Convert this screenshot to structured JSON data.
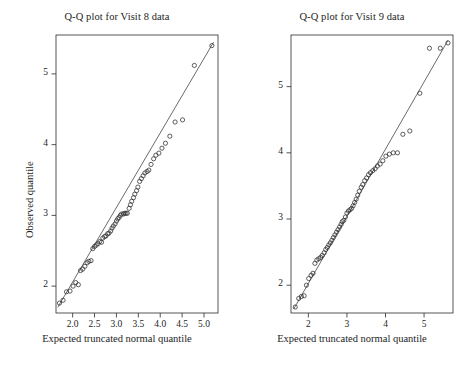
{
  "figure": {
    "width": 469,
    "height": 366,
    "background": "#ffffff",
    "ink_color": "#2b2b2b",
    "marker": "open-circle"
  },
  "chart_data": [
    {
      "type": "scatter",
      "panel": "left",
      "title": "Q-Q plot for Visit 8 data",
      "xlabel": "Expected truncated normal quantile",
      "ylabel": "Observed quantile",
      "grid": false,
      "legend": null,
      "xlim": [
        1.62,
        5.32
      ],
      "ylim": [
        1.62,
        5.55
      ],
      "xticks": [
        "2.0",
        "2.5",
        "3.0",
        "3.5",
        "4.0",
        "4.5",
        "5.0"
      ],
      "xtick_values": [
        2.0,
        2.5,
        3.0,
        3.5,
        4.0,
        4.5,
        5.0
      ],
      "yticks": [
        "2",
        "3",
        "4",
        "5"
      ],
      "ytick_values": [
        2,
        3,
        4,
        5
      ],
      "reference_line": {
        "x0": 1.66,
        "y0": 1.7,
        "x1": 5.22,
        "y1": 5.45
      },
      "x": [
        1.7,
        1.78,
        1.86,
        1.94,
        2.01,
        2.07,
        2.13,
        2.18,
        2.23,
        2.28,
        2.33,
        2.37,
        2.42,
        2.46,
        2.5,
        2.54,
        2.58,
        2.62,
        2.66,
        2.69,
        2.73,
        2.76,
        2.8,
        2.83,
        2.87,
        2.9,
        2.93,
        2.97,
        3.0,
        3.03,
        3.06,
        3.09,
        3.12,
        3.16,
        3.19,
        3.22,
        3.25,
        3.29,
        3.32,
        3.35,
        3.39,
        3.42,
        3.46,
        3.49,
        3.53,
        3.57,
        3.61,
        3.65,
        3.7,
        3.74,
        3.79,
        3.85,
        3.9,
        3.97,
        4.04,
        4.12,
        4.22,
        4.34,
        4.51,
        4.78,
        5.18
      ],
      "y": [
        1.76,
        1.8,
        1.92,
        1.93,
        2.0,
        2.05,
        2.02,
        2.22,
        2.24,
        2.28,
        2.33,
        2.35,
        2.36,
        2.53,
        2.56,
        2.58,
        2.6,
        2.63,
        2.62,
        2.68,
        2.7,
        2.71,
        2.74,
        2.75,
        2.78,
        2.82,
        2.85,
        2.88,
        2.92,
        2.95,
        2.97,
        3.0,
        3.02,
        3.02,
        3.03,
        3.03,
        3.03,
        3.1,
        3.15,
        3.2,
        3.25,
        3.3,
        3.35,
        3.4,
        3.48,
        3.52,
        3.56,
        3.6,
        3.62,
        3.64,
        3.72,
        3.8,
        3.85,
        3.88,
        3.95,
        4.02,
        4.12,
        4.32,
        4.35,
        5.12,
        5.4
      ]
    },
    {
      "type": "scatter",
      "panel": "right",
      "title": "Q-Q plot for Visit 9 data",
      "xlabel": "Expected truncated normal quantile",
      "ylabel": "Observed quantile",
      "grid": false,
      "legend": null,
      "xlim": [
        1.55,
        5.75
      ],
      "ylim": [
        1.58,
        5.78
      ],
      "xticks": [
        "2",
        "3",
        "4",
        "5"
      ],
      "xtick_values": [
        2,
        3,
        4,
        5
      ],
      "yticks": [
        "2",
        "3",
        "4",
        "5"
      ],
      "ytick_values": [
        2,
        3,
        4,
        5
      ],
      "reference_line": {
        "x0": 1.62,
        "y0": 1.64,
        "x1": 5.62,
        "y1": 5.7
      },
      "x": [
        1.66,
        1.75,
        1.82,
        1.89,
        1.95,
        2.01,
        2.07,
        2.12,
        2.17,
        2.22,
        2.27,
        2.32,
        2.36,
        2.41,
        2.45,
        2.49,
        2.53,
        2.57,
        2.61,
        2.65,
        2.69,
        2.73,
        2.77,
        2.81,
        2.85,
        2.88,
        2.92,
        2.96,
        3.0,
        3.04,
        3.08,
        3.12,
        3.16,
        3.2,
        3.24,
        3.28,
        3.32,
        3.37,
        3.41,
        3.46,
        3.51,
        3.56,
        3.61,
        3.67,
        3.73,
        3.79,
        3.86,
        3.93,
        4.01,
        4.1,
        4.2,
        4.31,
        4.45,
        4.63,
        4.89,
        5.14,
        5.42,
        5.62
      ],
      "y": [
        1.67,
        1.8,
        1.83,
        1.84,
        2.0,
        2.1,
        2.15,
        2.18,
        2.33,
        2.38,
        2.4,
        2.42,
        2.45,
        2.49,
        2.54,
        2.57,
        2.61,
        2.64,
        2.68,
        2.72,
        2.76,
        2.8,
        2.84,
        2.88,
        2.92,
        2.96,
        2.98,
        3.03,
        3.09,
        3.12,
        3.14,
        3.16,
        3.2,
        3.25,
        3.3,
        3.36,
        3.42,
        3.48,
        3.52,
        3.58,
        3.62,
        3.67,
        3.7,
        3.73,
        3.76,
        3.8,
        3.83,
        3.88,
        3.95,
        3.98,
        4.0,
        4.0,
        4.28,
        4.33,
        4.9,
        5.58,
        5.58,
        5.66
      ]
    }
  ]
}
